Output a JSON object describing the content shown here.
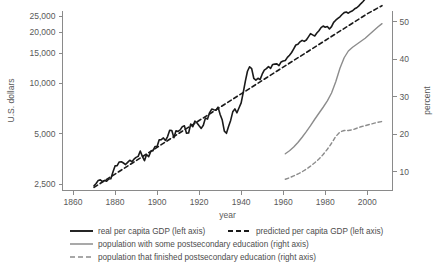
{
  "chart_data": {
    "type": "line",
    "title": "",
    "xlabel": "year",
    "ylabel_left": "U.S. dollars",
    "ylabel_right": "percent",
    "xlim": [
      1855,
      2012
    ],
    "ylim_left": [
      2300,
      27000
    ],
    "ylim_right": [
      5,
      53
    ],
    "left_axis_scale": "log",
    "right_axis_scale": "linear",
    "grid": false,
    "legend_position": "below",
    "xticks": [
      1860,
      1880,
      1900,
      1920,
      1940,
      1960,
      1980,
      2000
    ],
    "xtick_labels": [
      "1860",
      "1880",
      "1900",
      "1920",
      "1940",
      "1960",
      "1980",
      "2000"
    ],
    "yticks_left": [
      2500,
      5000,
      10000,
      15000,
      20000,
      25000
    ],
    "ytick_labels_left": [
      "2,500",
      "5,000",
      "10,000",
      "15,000",
      "20,000",
      "25,000"
    ],
    "yticks_right": [
      10,
      20,
      30,
      40,
      50
    ],
    "ytick_labels_right": [
      "10",
      "20",
      "30",
      "40",
      "50"
    ],
    "series": [
      {
        "name": "real per capita GDP (left axis)",
        "axis": "left",
        "color": "#1a1a1a",
        "style": "solid",
        "width": 1.6,
        "x": [
          1870,
          1871,
          1872,
          1873,
          1874,
          1875,
          1876,
          1877,
          1878,
          1879,
          1880,
          1881,
          1882,
          1883,
          1884,
          1885,
          1886,
          1887,
          1888,
          1889,
          1890,
          1891,
          1892,
          1893,
          1894,
          1895,
          1896,
          1897,
          1898,
          1899,
          1900,
          1901,
          1902,
          1903,
          1904,
          1905,
          1906,
          1907,
          1908,
          1909,
          1910,
          1911,
          1912,
          1913,
          1914,
          1915,
          1916,
          1917,
          1918,
          1919,
          1920,
          1921,
          1922,
          1923,
          1924,
          1925,
          1926,
          1927,
          1928,
          1929,
          1930,
          1931,
          1932,
          1933,
          1934,
          1935,
          1936,
          1937,
          1938,
          1939,
          1940,
          1941,
          1942,
          1943,
          1944,
          1945,
          1946,
          1947,
          1948,
          1949,
          1950,
          1951,
          1952,
          1953,
          1954,
          1955,
          1956,
          1957,
          1958,
          1959,
          1960,
          1961,
          1962,
          1963,
          1964,
          1965,
          1966,
          1967,
          1968,
          1969,
          1970,
          1971,
          1972,
          1973,
          1974,
          1975,
          1976,
          1977,
          1978,
          1979,
          1980,
          1981,
          1982,
          1983,
          1984,
          1985,
          1986,
          1987,
          1988,
          1989,
          1990,
          1991,
          1992,
          1993,
          1994,
          1995,
          1996,
          1997,
          1998,
          1999,
          2000,
          2001,
          2002,
          2003,
          2004,
          2005,
          2006,
          2007
        ],
        "y": [
          2450,
          2530,
          2640,
          2660,
          2600,
          2640,
          2610,
          2690,
          2700,
          2960,
          3220,
          3230,
          3400,
          3410,
          3350,
          3280,
          3380,
          3480,
          3410,
          3530,
          3620,
          3670,
          3950,
          3670,
          3460,
          3760,
          3650,
          3930,
          3960,
          4200,
          4200,
          4600,
          4610,
          4720,
          4560,
          4810,
          5250,
          5230,
          4740,
          5210,
          5160,
          5270,
          5510,
          5570,
          5040,
          5050,
          5710,
          5510,
          5940,
          5800,
          5580,
          5380,
          5620,
          6200,
          6110,
          6680,
          7010,
          6940,
          6900,
          7200,
          6500,
          6030,
          5180,
          5030,
          5520,
          6000,
          6750,
          7020,
          6660,
          7130,
          7630,
          8810,
          10270,
          11760,
          12500,
          12180,
          10680,
          10410,
          10680,
          10490,
          11290,
          11940,
          12180,
          12520,
          12230,
          12900,
          12960,
          13000,
          12700,
          13350,
          13530,
          13620,
          14220,
          14640,
          15200,
          15980,
          16840,
          17010,
          17590,
          17950,
          17690,
          18030,
          18820,
          19680,
          19340,
          19060,
          19840,
          20460,
          21360,
          21830,
          21470,
          21680,
          20960,
          21660,
          22950,
          23640,
          24210,
          24780,
          25560,
          26230,
          26430,
          26020,
          26570,
          26920,
          27640,
          28030,
          28770,
          29680,
          30560,
          31640,
          32610,
          32490,
          32760,
          33310,
          34150,
          34750,
          35280,
          35640
        ]
      },
      {
        "name": "predicted per capita GDP (left axis)",
        "axis": "left",
        "color": "#1a1a1a",
        "style": "dashed",
        "width": 1.6,
        "x": [
          1870,
          1880,
          1890,
          1900,
          1910,
          1920,
          1930,
          1940,
          1950,
          1960,
          1970,
          1980,
          1990,
          2000,
          2007
        ],
        "y": [
          2400,
          2880,
          3460,
          4150,
          4990,
          5990,
          7190,
          8630,
          10360,
          12440,
          14930,
          17920,
          21510,
          25820,
          28830
        ]
      },
      {
        "name": "population with some postsecondary education (right axis)",
        "axis": "right",
        "color": "#8c8c8c",
        "style": "solid",
        "width": 1.4,
        "x": [
          1961,
          1963,
          1965,
          1967,
          1969,
          1971,
          1973,
          1975,
          1977,
          1979,
          1981,
          1983,
          1985,
          1987,
          1989,
          1991,
          1993,
          1995,
          1997,
          1999,
          2001,
          2003,
          2005,
          2007
        ],
        "y": [
          14.8,
          15.6,
          16.6,
          17.8,
          19.2,
          20.7,
          22.3,
          24.0,
          25.6,
          27.2,
          28.9,
          31.0,
          34.0,
          37.6,
          40.4,
          42.2,
          43.2,
          44.0,
          44.8,
          45.6,
          46.6,
          47.6,
          48.6,
          49.5
        ]
      },
      {
        "name": "population that finished postsecondary education (right axis)",
        "axis": "right",
        "color": "#8c8c8c",
        "style": "dashed",
        "width": 1.4,
        "x": [
          1961,
          1963,
          1965,
          1967,
          1969,
          1971,
          1973,
          1975,
          1977,
          1979,
          1981,
          1983,
          1985,
          1987,
          1989,
          1991,
          1993,
          1995,
          1997,
          1999,
          2001,
          2003,
          2005,
          2007
        ],
        "y": [
          8.0,
          8.4,
          8.9,
          9.4,
          10.0,
          10.7,
          11.5,
          12.4,
          13.4,
          14.6,
          16.0,
          17.6,
          19.4,
          20.6,
          21.0,
          21.0,
          21.2,
          21.6,
          22.0,
          22.3,
          22.6,
          22.9,
          23.2,
          23.4
        ]
      }
    ]
  },
  "legend": {
    "items": [
      {
        "label": "real per capita GDP (left axis)",
        "style": "solid",
        "color": "#1a1a1a"
      },
      {
        "label": "predicted per capita GDP (left axis)",
        "style": "dashed",
        "color": "#1a1a1a"
      },
      {
        "label": "population with some postsecondary education (right axis)",
        "style": "solid",
        "color": "#8c8c8c"
      },
      {
        "label": "population that finished postsecondary education (right axis)",
        "style": "dashed",
        "color": "#8c8c8c"
      }
    ]
  }
}
